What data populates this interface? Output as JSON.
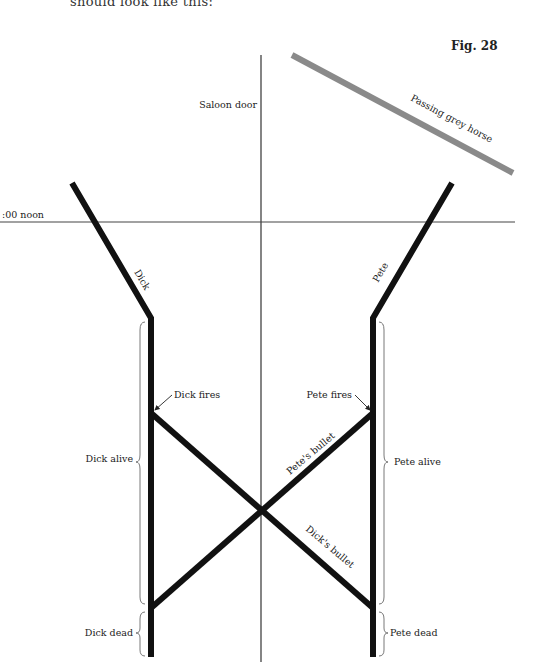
{
  "header": {
    "caption_fragment": "should look like this:",
    "figure_label": "Fig. 28"
  },
  "diagram": {
    "axes": {
      "vertical_label": "Saloon door",
      "horizontal_label": "12:00 noon",
      "horizontal_label_visible": ":00 noon"
    },
    "worldlines": {
      "horse": "Passing grey horse",
      "dick": "Dick",
      "pete": "Pete",
      "petes_bullet": "Pete's bullet",
      "dicks_bullet": "Dick's bullet"
    },
    "events": {
      "dick_fires": "Dick fires",
      "pete_fires": "Pete fires"
    },
    "intervals": {
      "dick_alive": "Dick alive",
      "dick_dead": "Dick dead",
      "pete_alive": "Pete alive",
      "pete_dead": "Pete dead"
    },
    "colors": {
      "worldline": "#111111",
      "horse": "#8a8a8a",
      "axis": "#333333"
    }
  }
}
